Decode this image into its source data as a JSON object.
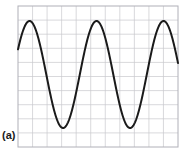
{
  "figure": {
    "panel_label": "(a)",
    "kind": "oscilloscope-waveform",
    "background_color": "#ffffff",
    "grid": {
      "columns": 11,
      "rows": 10,
      "left": 18,
      "top": 6,
      "right": 178,
      "bottom": 147,
      "cell_width": 14.55,
      "cell_height": 14.1,
      "line_color": "#c8c8cd",
      "border_color": "#b0b0b8",
      "line_width": 0.7,
      "border_width": 1.0,
      "visible": true
    },
    "trace": {
      "color": "#1a1a1a",
      "line_width": 2.0,
      "cap": "round"
    }
  },
  "chart_data": {
    "type": "line",
    "title": "",
    "subtitle": "",
    "xlabel": "",
    "ylabel": "",
    "annotations": [
      "(a)"
    ],
    "legend": [],
    "legend_position": "none",
    "grid": true,
    "xlim": [
      18,
      178
    ],
    "ylim": [
      147,
      6
    ],
    "axis_ticks_visible": false,
    "tick_labels_x": [],
    "tick_labels_y": [],
    "waveform": {
      "shape": "sine",
      "cycles": 2.4,
      "period_px": 67,
      "amplitude_px": 53.5,
      "midline_y_px": 74.5,
      "peak_y_px": 21,
      "trough_y_px": 128,
      "phase_deg": 28,
      "start_point": {
        "x": 18,
        "y": 72
      },
      "end_point": {
        "x": 178,
        "y": 40
      },
      "peaks": [
        {
          "x": 34,
          "y": 21
        },
        {
          "x": 101,
          "y": 21
        },
        {
          "x": 168,
          "y": 21
        }
      ],
      "troughs": [
        {
          "x": 68,
          "y": 128
        },
        {
          "x": 135,
          "y": 128
        }
      ]
    },
    "series": [
      {
        "name": "waveform",
        "color": "#1a1a1a",
        "x": [
          18,
          20,
          22,
          24,
          26,
          28,
          30,
          32,
          34,
          36,
          38,
          40,
          42,
          44,
          46,
          48,
          50,
          52,
          54,
          56,
          58,
          60,
          62,
          64,
          66,
          68,
          70,
          72,
          74,
          76,
          78,
          80,
          82,
          84,
          86,
          88,
          90,
          92,
          94,
          96,
          98,
          100,
          102,
          104,
          106,
          108,
          110,
          112,
          114,
          116,
          118,
          120,
          122,
          124,
          126,
          128,
          130,
          132,
          134,
          136,
          138,
          140,
          142,
          144,
          146,
          148,
          150,
          152,
          154,
          156,
          158,
          160,
          162,
          164,
          166,
          168,
          170,
          172,
          174,
          176,
          178
        ],
        "y": [
          72.0,
          63.1,
          54.3,
          45.9,
          38.3,
          31.8,
          26.7,
          23.2,
          21.4,
          21.4,
          23.2,
          26.7,
          31.8,
          38.3,
          45.9,
          54.3,
          63.1,
          72.0,
          80.6,
          88.7,
          96.1,
          106.6,
          113.4,
          118.8,
          123.1,
          126.3,
          127.9,
          127.9,
          126.3,
          123.1,
          118.8,
          113.4,
          106.6,
          96.1,
          88.7,
          80.6,
          72.0,
          63.1,
          54.3,
          45.9,
          38.3,
          31.8,
          26.7,
          23.2,
          21.4,
          21.4,
          23.2,
          26.7,
          31.8,
          38.3,
          45.9,
          54.3,
          63.1,
          72.0,
          80.6,
          88.7,
          96.1,
          106.6,
          113.4,
          118.8,
          123.1,
          126.3,
          127.9,
          127.9,
          126.3,
          123.1,
          118.8,
          113.4,
          106.6,
          96.1,
          88.7,
          80.6,
          72.0,
          54.3,
          38.3,
          26.7,
          21.4,
          23.2,
          31.8,
          38.3,
          40.0
        ]
      }
    ]
  }
}
